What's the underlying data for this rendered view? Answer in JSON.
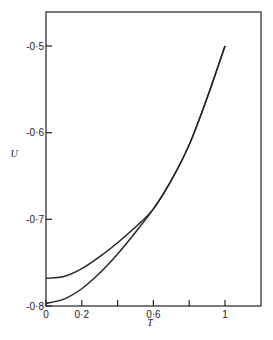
{
  "chart_data": {
    "type": "line",
    "title": "",
    "xlabel": "T",
    "ylabel": "U",
    "xlim": [
      0,
      1.2
    ],
    "ylim": [
      -0.8,
      -0.43
    ],
    "grid": false,
    "legend": null,
    "x_ticks": [
      {
        "value": 0,
        "label": "0"
      },
      {
        "value": 0.2,
        "label": "0·2"
      },
      {
        "value": 0.4,
        "label": ""
      },
      {
        "value": 0.6,
        "label": "0·6"
      },
      {
        "value": 0.8,
        "label": ""
      },
      {
        "value": 1.0,
        "label": "1"
      }
    ],
    "y_ticks": [
      {
        "value": -0.5,
        "label": "-0·5"
      },
      {
        "value": -0.6,
        "label": "-0·6"
      },
      {
        "value": -0.7,
        "label": "-0·7"
      },
      {
        "value": -0.8,
        "label": "-0·8"
      }
    ],
    "x": [
      0,
      0.1,
      0.2,
      0.3,
      0.4,
      0.5,
      0.6,
      0.7,
      0.8,
      0.9,
      1.0
    ],
    "series": [
      {
        "name": "upper curve",
        "values": [
          -0.768,
          -0.766,
          -0.757,
          -0.743,
          -0.727,
          -0.709,
          -0.688,
          -0.655,
          -0.614,
          -0.56,
          -0.5
        ]
      },
      {
        "name": "lower curve",
        "values": [
          -0.797,
          -0.792,
          -0.78,
          -0.762,
          -0.74,
          -0.715,
          -0.688,
          -0.655,
          -0.614,
          -0.56,
          -0.5
        ]
      }
    ]
  }
}
